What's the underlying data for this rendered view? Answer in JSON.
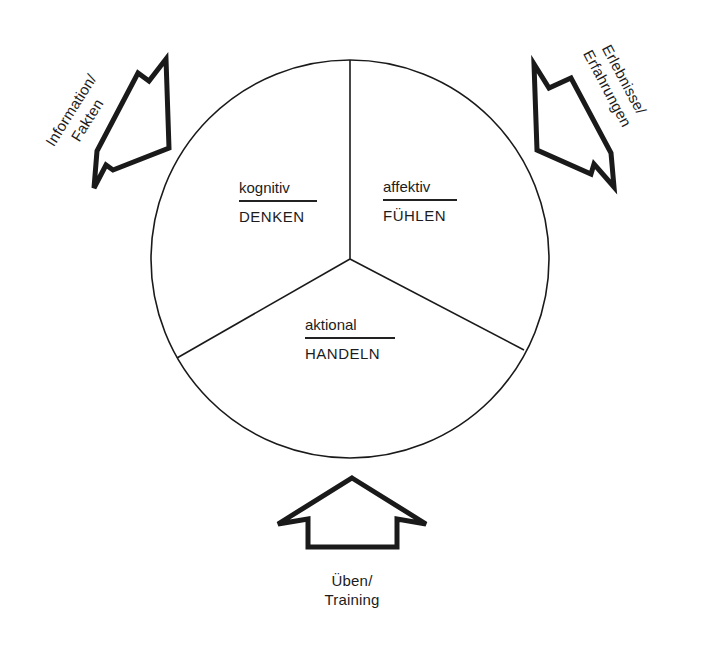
{
  "diagram": {
    "type": "circle-three-sectors-with-input-arrows",
    "circle": {
      "sectors": [
        {
          "id": "kognitiv",
          "adjective": "kognitiv",
          "verb": "DENKEN"
        },
        {
          "id": "affektiv",
          "adjective": "affektiv",
          "verb": "FÜHLEN"
        },
        {
          "id": "aktional",
          "adjective": "aktional",
          "verb": "HANDELN"
        }
      ]
    },
    "arrows": [
      {
        "id": "information",
        "position": "upper-left",
        "points_to": "kognitiv",
        "line1": "Information/",
        "line2": "Fakten"
      },
      {
        "id": "erlebnisse",
        "position": "upper-right",
        "points_to": "affektiv",
        "line1": "Erlebnisse/",
        "line2": "Erfahrungen"
      },
      {
        "id": "ueben",
        "position": "bottom",
        "points_to": "aktional",
        "line1": "Üben/",
        "line2": "Training"
      }
    ],
    "colors": {
      "stroke": "#1a1a1a",
      "background": "#ffffff"
    }
  }
}
